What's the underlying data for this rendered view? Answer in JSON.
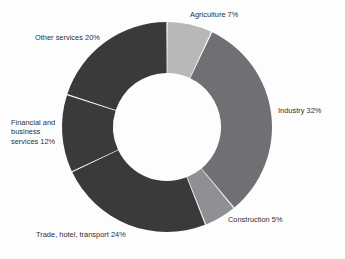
{
  "chart_data": {
    "type": "pie",
    "variant": "donut",
    "title": "",
    "subtitle": "",
    "xlabel": "",
    "ylabel": "",
    "grid": false,
    "legend_position": "none",
    "labels_outside": true,
    "start_angle_deg": 0,
    "direction": "clockwise",
    "hole_ratio": 0.51,
    "units": "percent",
    "total": 100,
    "categories": [
      "Agriculture",
      "Industry",
      "Construction",
      "Trade, hotel, transport",
      "Financial and business services",
      "Other services"
    ],
    "values": [
      7,
      32,
      5,
      24,
      12,
      20
    ],
    "slices": [
      {
        "name": "Agriculture",
        "value": 7,
        "label": "Agriculture 7%",
        "color": "#b8b8b8"
      },
      {
        "name": "Industry",
        "value": 32,
        "label": "Industry 32%",
        "color": "#6e7073"
      },
      {
        "name": "Construction",
        "value": 5,
        "label": "Construction 5%",
        "color": "#8e9094"
      },
      {
        "name": "Trade, hotel, transport",
        "value": 24,
        "label": "Trade, hotel, transport 24%",
        "color": "#3a3a3a"
      },
      {
        "name": "Financial and business services",
        "value": 12,
        "label": "Financial and\nbusiness\nservices 12%",
        "color": "#3a3a3a"
      },
      {
        "name": "Other services",
        "value": 20,
        "label": "Other services 20%",
        "color": "#3a3a3a"
      }
    ]
  },
  "figure": {
    "background_color": "#fdfdfd",
    "separator_color": "#ffffff",
    "label_text_color": "#2d2d2d",
    "center_x": 167,
    "center_y": 127,
    "outer_radius": 105,
    "inner_radius": 54
  }
}
